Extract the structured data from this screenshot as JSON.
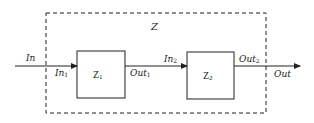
{
  "diagram": {
    "type": "block-diagram",
    "outer_block": {
      "label": "Z",
      "style": "dashed"
    },
    "blocks": [
      {
        "id": "Z1",
        "label": "Z",
        "subscript": "1"
      },
      {
        "id": "Z2",
        "label": "Z",
        "subscript": "2"
      }
    ],
    "signals": {
      "input": {
        "label": "In"
      },
      "in1": {
        "label": "In",
        "subscript": "1"
      },
      "out1": {
        "label": "Out",
        "subscript": "1"
      },
      "in2": {
        "label": "In",
        "subscript": "2"
      },
      "out2": {
        "label": "Out",
        "subscript": "2"
      },
      "output": {
        "label": "Out"
      }
    },
    "edges": [
      {
        "from": "In",
        "to": "Z1"
      },
      {
        "from": "Z1",
        "to": "Z2"
      },
      {
        "from": "Z2",
        "to": "Out"
      }
    ],
    "colors": {
      "stroke": "#222222",
      "background": "#ffffff"
    }
  }
}
